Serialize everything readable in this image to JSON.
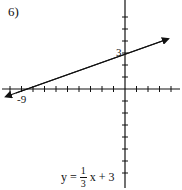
{
  "problem_number": "6)",
  "graph": {
    "origin_px": [
      125,
      89
    ],
    "x_unit_px": 11.5,
    "y_unit_px": 12,
    "x_tick_range": [
      -10,
      4
    ],
    "y_tick_range": [
      -7,
      6
    ],
    "x_label": "-9",
    "y_label": "3",
    "line": {
      "slope": "1/3",
      "intercept": 3,
      "arrows": "both"
    }
  },
  "equation": {
    "lhs": "y =",
    "numerator": "1",
    "denominator": "3",
    "rhs": "x + 3"
  }
}
